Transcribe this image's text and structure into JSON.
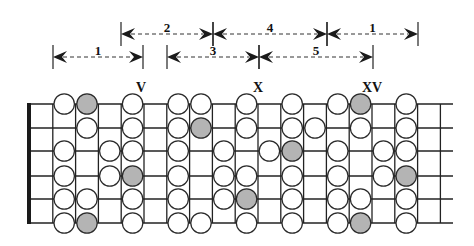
{
  "diagram": {
    "colors": {
      "line": "#222222",
      "nut": "#1a1a1a",
      "note_fill": "#ffffff",
      "root_fill": "#b4b4b4",
      "stroke": "#2a2a2a"
    },
    "position_markers": [
      {
        "label": "V",
        "x": 141,
        "y": 92
      },
      {
        "label": "X",
        "x": 258,
        "y": 92
      },
      {
        "label": "XV",
        "x": 372,
        "y": 92
      }
    ],
    "span_arrows": [
      {
        "label": "2",
        "row": 1,
        "x1": 121,
        "x2": 213
      },
      {
        "label": "4",
        "row": 1,
        "x1": 213,
        "x2": 327
      },
      {
        "label": "1",
        "row": 1,
        "x1": 327,
        "x2": 418
      },
      {
        "label": "1",
        "row": 2,
        "x1": 53,
        "x2": 143
      },
      {
        "label": "3",
        "row": 2,
        "x1": 167,
        "x2": 259
      },
      {
        "label": "5",
        "row": 2,
        "x1": 259,
        "x2": 373
      }
    ],
    "strings": 6,
    "frets_shown": 18,
    "notes": [
      {
        "string": 1,
        "fret": 2,
        "root": false
      },
      {
        "string": 1,
        "fret": 3,
        "root": true
      },
      {
        "string": 1,
        "fret": 5,
        "root": false
      },
      {
        "string": 1,
        "fret": 7,
        "root": false
      },
      {
        "string": 1,
        "fret": 8,
        "root": false
      },
      {
        "string": 1,
        "fret": 10,
        "root": false
      },
      {
        "string": 1,
        "fret": 12,
        "root": false
      },
      {
        "string": 1,
        "fret": 14,
        "root": false
      },
      {
        "string": 1,
        "fret": 15,
        "root": true
      },
      {
        "string": 1,
        "fret": 17,
        "root": false
      },
      {
        "string": 2,
        "fret": 3,
        "root": false
      },
      {
        "string": 2,
        "fret": 5,
        "root": false
      },
      {
        "string": 2,
        "fret": 7,
        "root": false
      },
      {
        "string": 2,
        "fret": 8,
        "root": true
      },
      {
        "string": 2,
        "fret": 10,
        "root": false
      },
      {
        "string": 2,
        "fret": 12,
        "root": false
      },
      {
        "string": 2,
        "fret": 13,
        "root": false
      },
      {
        "string": 2,
        "fret": 15,
        "root": false
      },
      {
        "string": 2,
        "fret": 17,
        "root": false
      },
      {
        "string": 3,
        "fret": 2,
        "root": false
      },
      {
        "string": 3,
        "fret": 4,
        "root": false
      },
      {
        "string": 3,
        "fret": 5,
        "root": false
      },
      {
        "string": 3,
        "fret": 7,
        "root": false
      },
      {
        "string": 3,
        "fret": 9,
        "root": false
      },
      {
        "string": 3,
        "fret": 11,
        "root": false
      },
      {
        "string": 3,
        "fret": 12,
        "root": true
      },
      {
        "string": 3,
        "fret": 14,
        "root": false
      },
      {
        "string": 3,
        "fret": 16,
        "root": false
      },
      {
        "string": 3,
        "fret": 17,
        "root": false
      },
      {
        "string": 4,
        "fret": 2,
        "root": false
      },
      {
        "string": 4,
        "fret": 4,
        "root": false
      },
      {
        "string": 4,
        "fret": 5,
        "root": true
      },
      {
        "string": 4,
        "fret": 7,
        "root": false
      },
      {
        "string": 4,
        "fret": 9,
        "root": false
      },
      {
        "string": 4,
        "fret": 10,
        "root": false
      },
      {
        "string": 4,
        "fret": 12,
        "root": false
      },
      {
        "string": 4,
        "fret": 14,
        "root": false
      },
      {
        "string": 4,
        "fret": 16,
        "root": false
      },
      {
        "string": 4,
        "fret": 17,
        "root": true
      },
      {
        "string": 5,
        "fret": 2,
        "root": false
      },
      {
        "string": 5,
        "fret": 3,
        "root": false
      },
      {
        "string": 5,
        "fret": 5,
        "root": false
      },
      {
        "string": 5,
        "fret": 7,
        "root": false
      },
      {
        "string": 5,
        "fret": 9,
        "root": false
      },
      {
        "string": 5,
        "fret": 10,
        "root": true
      },
      {
        "string": 5,
        "fret": 12,
        "root": false
      },
      {
        "string": 5,
        "fret": 14,
        "root": false
      },
      {
        "string": 5,
        "fret": 15,
        "root": false
      },
      {
        "string": 5,
        "fret": 17,
        "root": false
      },
      {
        "string": 6,
        "fret": 2,
        "root": false
      },
      {
        "string": 6,
        "fret": 3,
        "root": true
      },
      {
        "string": 6,
        "fret": 5,
        "root": false
      },
      {
        "string": 6,
        "fret": 7,
        "root": false
      },
      {
        "string": 6,
        "fret": 8,
        "root": false
      },
      {
        "string": 6,
        "fret": 10,
        "root": false
      },
      {
        "string": 6,
        "fret": 12,
        "root": false
      },
      {
        "string": 6,
        "fret": 14,
        "root": false
      },
      {
        "string": 6,
        "fret": 15,
        "root": true
      },
      {
        "string": 6,
        "fret": 17,
        "root": false
      }
    ]
  }
}
